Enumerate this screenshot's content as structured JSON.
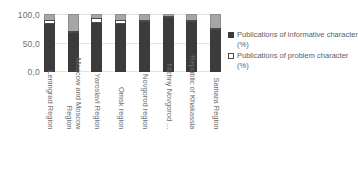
{
  "chart_data": {
    "type": "bar",
    "subtype": "stacked-column",
    "title": "",
    "xlabel": "",
    "ylabel": "",
    "ylim": [
      0,
      100
    ],
    "yticks": [
      "0,0",
      "50,0",
      "100,0"
    ],
    "ytick_values": [
      0,
      50,
      100
    ],
    "grid": true,
    "decimal_separator": ",",
    "legend_position": "right",
    "categories": [
      "Leningrad Region",
      "Moscow and Moscow Region",
      "Yaroslavl Region",
      "Omsk region",
      "Novgorod region",
      "Nizhny Novgorod ...",
      "Republic of Khakassia",
      "Samara Region"
    ],
    "series": [
      {
        "name": "Publications of informative character (%)",
        "color": "#3b3b3b",
        "values": [
          82,
          68,
          84,
          83,
          88,
          95,
          87,
          72
        ]
      },
      {
        "name": "Publications of problem character (%)",
        "color": "#ffffff",
        "values": [
          8,
          2,
          9,
          7,
          2,
          1,
          2,
          3
        ]
      },
      {
        "name": "",
        "color": "#a6a6a6",
        "values": [
          10,
          30,
          7,
          10,
          10,
          4,
          11,
          25
        ]
      }
    ]
  },
  "legend": {
    "entries": [
      {
        "label": "Publications  of informative character (%)",
        "swatch": "dark-square-swatch"
      },
      {
        "label": "Publications  of problem character (%)",
        "swatch": "white-square-swatch"
      }
    ]
  }
}
